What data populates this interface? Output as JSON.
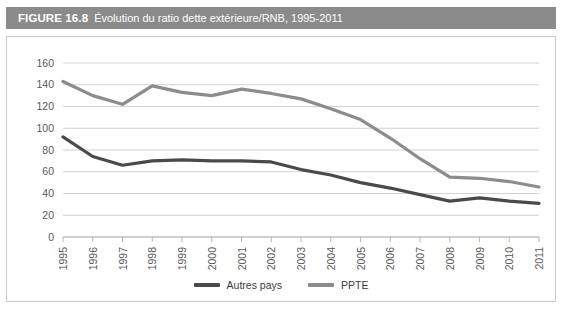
{
  "figure": {
    "label": "FIGURE 16.8",
    "caption": "Évolution du ratio dette extérieure/RNB, 1995-2011",
    "header_bg": "#8b8b8b",
    "panel_border": "#c9c9c9"
  },
  "chart_data": {
    "type": "line",
    "title": "Évolution du ratio dette extérieure/RNB, 1995-2011",
    "xlabel": "",
    "ylabel": "",
    "x": [
      "1995",
      "1996",
      "1997",
      "1998",
      "1999",
      "2000",
      "2001",
      "2002",
      "2003",
      "2004",
      "2005",
      "2006",
      "2007",
      "2008",
      "2009",
      "2010",
      "2011"
    ],
    "categories": [
      "1995",
      "1996",
      "1997",
      "1998",
      "1999",
      "2000",
      "2001",
      "2002",
      "2003",
      "2004",
      "2005",
      "2006",
      "2007",
      "2008",
      "2009",
      "2010",
      "2011"
    ],
    "yticks": [
      0,
      20,
      40,
      60,
      80,
      100,
      120,
      140,
      160
    ],
    "ylim": [
      0,
      160
    ],
    "grid": true,
    "legend_position": "bottom",
    "series": [
      {
        "name": "Autres pays",
        "color": "#4a4a4a",
        "values": [
          92,
          74,
          66,
          70,
          71,
          70,
          70,
          69,
          62,
          57,
          50,
          45,
          39,
          33,
          36,
          33,
          31
        ]
      },
      {
        "name": "PPTE",
        "color": "#8c8c8c",
        "values": [
          143,
          130,
          122,
          139,
          133,
          130,
          136,
          132,
          127,
          118,
          108,
          91,
          72,
          55,
          54,
          51,
          46
        ]
      }
    ]
  },
  "legend": {
    "items": [
      {
        "label": "Autres pays",
        "color": "#4a4a4a"
      },
      {
        "label": "PPTE",
        "color": "#8c8c8c"
      }
    ]
  }
}
